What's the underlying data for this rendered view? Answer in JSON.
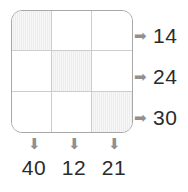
{
  "diagram": {
    "type": "grid-sum-puzzle",
    "grid": {
      "rows": 3,
      "columns": 3,
      "cells": [
        [
          {
            "shaded": true,
            "value": ""
          },
          {
            "shaded": false,
            "value": ""
          },
          {
            "shaded": false,
            "value": ""
          }
        ],
        [
          {
            "shaded": false,
            "value": ""
          },
          {
            "shaded": true,
            "value": ""
          },
          {
            "shaded": false,
            "value": ""
          }
        ],
        [
          {
            "shaded": false,
            "value": ""
          },
          {
            "shaded": false,
            "value": ""
          },
          {
            "shaded": true,
            "value": ""
          }
        ]
      ]
    },
    "row_sums": [
      {
        "arrow_icon": "arrow-right-icon",
        "arrow_glyph": "➡",
        "value": "14"
      },
      {
        "arrow_icon": "arrow-right-icon",
        "arrow_glyph": "➡",
        "value": "24"
      },
      {
        "arrow_icon": "arrow-right-icon",
        "arrow_glyph": "➡",
        "value": "30"
      }
    ],
    "column_sums": [
      {
        "arrow_icon": "arrow-down-icon",
        "arrow_glyph": "⬇",
        "value": "40"
      },
      {
        "arrow_icon": "arrow-down-icon",
        "arrow_glyph": "⬇",
        "value": "12"
      },
      {
        "arrow_icon": "arrow-down-icon",
        "arrow_glyph": "⬇",
        "value": "21"
      }
    ],
    "colors": {
      "shaded_cell": "#ededed",
      "cell_background": "#ffffff",
      "grid_line": "#cdcdcd",
      "outer_border": "#a8a8a8",
      "arrow": "#909090",
      "number_text": "#2b2b2b",
      "page_background": "#ffffff"
    }
  },
  "chart_data": {
    "type": "table",
    "title": "",
    "categories": [
      "Column 1",
      "Column 2",
      "Column 3"
    ],
    "row_labels": [
      "Row 1",
      "Row 2",
      "Row 3"
    ],
    "shaded_cells": [
      [
        0,
        0
      ],
      [
        1,
        1
      ],
      [
        2,
        2
      ]
    ],
    "row_sums": [
      14,
      24,
      30
    ],
    "column_sums": [
      40,
      12,
      21
    ]
  }
}
